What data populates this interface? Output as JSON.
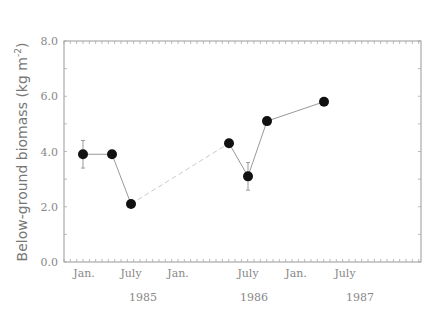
{
  "chart_data": {
    "type": "line",
    "title": "",
    "xlabel": "",
    "ylabel": "Below-ground biomass (kg m⁻²)",
    "ylim": [
      0,
      8
    ],
    "yticks": [
      "0.0",
      "2.0",
      "4.0",
      "6.0",
      "8.0"
    ],
    "xticks": [
      "Jan.",
      "July",
      "Jan.",
      "July",
      "Jan.",
      "July"
    ],
    "year_labels": [
      "1985",
      "1986",
      "1987"
    ],
    "grid": false,
    "legend": null,
    "x": [
      "1985-01",
      "1985-04",
      "1985-06",
      "1986-05",
      "1986-07",
      "1986-09",
      "1987-01"
    ],
    "series": [
      {
        "name": "Below-ground biomass",
        "values": [
          3.9,
          3.9,
          2.1,
          4.3,
          3.1,
          5.1,
          5.8
        ],
        "error_bars": [
          [
            3.4,
            4.4
          ],
          null,
          null,
          null,
          [
            2.6,
            3.6
          ],
          null,
          null
        ]
      }
    ]
  },
  "axis": {
    "y_title": "Below-ground biomass (kg m",
    "y_exp": "-2",
    "y_close": ")"
  }
}
